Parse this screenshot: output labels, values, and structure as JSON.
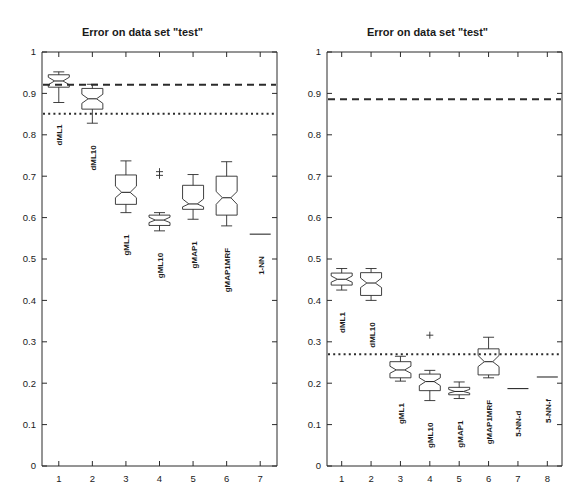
{
  "figure": {
    "background": "#ffffff",
    "line_color": "#2b2b2b",
    "panels": [
      "left",
      "right"
    ]
  },
  "chart_data": [
    {
      "type": "box",
      "panel": "left",
      "title": "Error on data set \"test\"",
      "xlabel": "",
      "ylabel": "",
      "ylim": [
        0,
        1
      ],
      "xlim": [
        0.5,
        7.5
      ],
      "grid": false,
      "legend": "none",
      "ytick_labels": [
        "0",
        "0.1",
        "0.2",
        "0.3",
        "0.4",
        "0.5",
        "0.6",
        "0.7",
        "0.8",
        "0.9",
        "1"
      ],
      "ytick_values": [
        0,
        0.1,
        0.2,
        0.3,
        0.4,
        0.5,
        0.6,
        0.7,
        0.8,
        0.9,
        1
      ],
      "xtick_labels": [
        "1",
        "2",
        "3",
        "4",
        "5",
        "6",
        "7"
      ],
      "xtick_values": [
        1,
        2,
        3,
        4,
        5,
        6,
        7
      ],
      "categories": [
        "dML1",
        "dML10",
        "gML1",
        "gML10",
        "gMAP1",
        "gMAP1MRF",
        "1-NN"
      ],
      "boxes": [
        {
          "x": 1,
          "label": "dML1",
          "whisker_low": 0.878,
          "q1": 0.915,
          "median": 0.93,
          "q3": 0.945,
          "whisker_high": 0.952,
          "notch_low": 0.921,
          "notch_high": 0.939,
          "outliers": []
        },
        {
          "x": 2,
          "label": "dML10",
          "whisker_low": 0.828,
          "q1": 0.862,
          "median": 0.887,
          "q3": 0.912,
          "whisker_high": 0.922,
          "notch_low": 0.876,
          "notch_high": 0.898,
          "outliers": []
        },
        {
          "x": 3,
          "label": "gML1",
          "whisker_low": 0.612,
          "q1": 0.632,
          "median": 0.661,
          "q3": 0.703,
          "whisker_high": 0.737,
          "notch_low": 0.648,
          "notch_high": 0.676,
          "outliers": []
        },
        {
          "x": 4,
          "label": "gML10",
          "whisker_low": 0.568,
          "q1": 0.581,
          "median": 0.594,
          "q3": 0.606,
          "whisker_high": 0.612,
          "notch_low": 0.588,
          "notch_high": 0.601,
          "outliers": [
            0.702,
            0.711
          ]
        },
        {
          "x": 5,
          "label": "gMAP1",
          "whisker_low": 0.596,
          "q1": 0.62,
          "median": 0.633,
          "q3": 0.678,
          "whisker_high": 0.704,
          "notch_low": 0.626,
          "notch_high": 0.645,
          "outliers": []
        },
        {
          "x": 6,
          "label": "gMAP1MRF",
          "whisker_low": 0.58,
          "q1": 0.606,
          "median": 0.648,
          "q3": 0.7,
          "whisker_high": 0.735,
          "notch_low": 0.632,
          "notch_high": 0.663,
          "outliers": []
        },
        {
          "x": 7,
          "label": "1-NN",
          "whisker_low": 0.56,
          "q1": 0.56,
          "median": 0.56,
          "q3": 0.56,
          "whisker_high": 0.56,
          "notch_low": 0.56,
          "notch_high": 0.56,
          "outliers": []
        }
      ],
      "reference_lines": [
        {
          "name": "dashed-reference",
          "value": 0.921,
          "style": "dashed"
        },
        {
          "name": "dotted-reference",
          "value": 0.851,
          "style": "dotted"
        }
      ]
    },
    {
      "type": "box",
      "panel": "right",
      "title": "Error on data set \"test\"",
      "xlabel": "",
      "ylabel": "",
      "ylim": [
        0,
        1
      ],
      "xlim": [
        0.5,
        8.5
      ],
      "grid": false,
      "legend": "none",
      "ytick_labels": [
        "0",
        "0.1",
        "0.2",
        "0.3",
        "0.4",
        "0.5",
        "0.6",
        "0.7",
        "0.8",
        "0.9",
        "1"
      ],
      "ytick_values": [
        0,
        0.1,
        0.2,
        0.3,
        0.4,
        0.5,
        0.6,
        0.7,
        0.8,
        0.9,
        1
      ],
      "xtick_labels": [
        "1",
        "2",
        "3",
        "4",
        "5",
        "6",
        "7",
        "8"
      ],
      "xtick_values": [
        1,
        2,
        3,
        4,
        5,
        6,
        7,
        8
      ],
      "categories": [
        "dML1",
        "dML10",
        "gML1",
        "gML10",
        "gMAP1",
        "gMAP1MRF",
        "5-NN-d",
        "5-NN-f"
      ],
      "boxes": [
        {
          "x": 1,
          "label": "dML1",
          "whisker_low": 0.425,
          "q1": 0.437,
          "median": 0.451,
          "q3": 0.466,
          "whisker_high": 0.477,
          "notch_low": 0.444,
          "notch_high": 0.459,
          "outliers": []
        },
        {
          "x": 2,
          "label": "dML10",
          "whisker_low": 0.4,
          "q1": 0.412,
          "median": 0.442,
          "q3": 0.467,
          "whisker_high": 0.477,
          "notch_low": 0.431,
          "notch_high": 0.454,
          "outliers": []
        },
        {
          "x": 3,
          "label": "gML1",
          "whisker_low": 0.205,
          "q1": 0.213,
          "median": 0.232,
          "q3": 0.252,
          "whisker_high": 0.265,
          "notch_low": 0.224,
          "notch_high": 0.241,
          "outliers": []
        },
        {
          "x": 4,
          "label": "gML10",
          "whisker_low": 0.158,
          "q1": 0.182,
          "median": 0.204,
          "q3": 0.222,
          "whisker_high": 0.231,
          "notch_low": 0.194,
          "notch_high": 0.213,
          "outliers": [
            0.316
          ]
        },
        {
          "x": 5,
          "label": "gMAP1",
          "whisker_low": 0.163,
          "q1": 0.172,
          "median": 0.18,
          "q3": 0.19,
          "whisker_high": 0.203,
          "notch_low": 0.176,
          "notch_high": 0.185,
          "outliers": []
        },
        {
          "x": 6,
          "label": "gMAP1MRF",
          "whisker_low": 0.213,
          "q1": 0.22,
          "median": 0.252,
          "q3": 0.283,
          "whisker_high": 0.311,
          "notch_low": 0.24,
          "notch_high": 0.267,
          "outliers": []
        },
        {
          "x": 7,
          "label": "5-NN-d",
          "whisker_low": 0.187,
          "q1": 0.187,
          "median": 0.187,
          "q3": 0.187,
          "whisker_high": 0.187,
          "notch_low": 0.187,
          "notch_high": 0.187,
          "outliers": []
        },
        {
          "x": 8,
          "label": "5-NN-f",
          "whisker_low": 0.215,
          "q1": 0.215,
          "median": 0.215,
          "q3": 0.215,
          "whisker_high": 0.215,
          "notch_low": 0.215,
          "notch_high": 0.215,
          "outliers": []
        }
      ],
      "reference_lines": [
        {
          "name": "dashed-reference",
          "value": 0.886,
          "style": "dashed"
        },
        {
          "name": "dotted-reference",
          "value": 0.27,
          "style": "dotted"
        }
      ]
    }
  ]
}
